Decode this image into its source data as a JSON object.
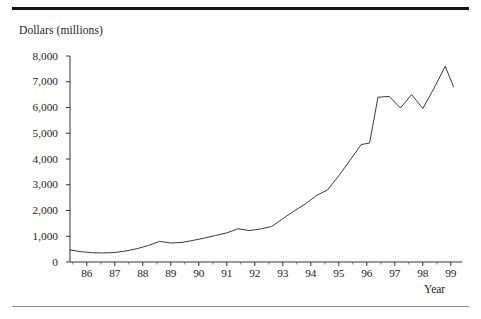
{
  "figure": {
    "y_axis_title": "Dollars (millions)",
    "x_axis_title": "Year"
  },
  "chart_data": {
    "type": "line",
    "title": "",
    "subtitle": "",
    "xlabel": "Year",
    "ylabel": "Dollars (millions)",
    "xlim": [
      85.4,
      99.4
    ],
    "ylim": [
      0,
      8000
    ],
    "grid": false,
    "legend": null,
    "y_ticks": [
      0,
      1000,
      2000,
      3000,
      4000,
      5000,
      6000,
      7000,
      8000
    ],
    "y_tick_labels": [
      "0",
      "1,000",
      "2,000",
      "3,000",
      "4,000",
      "5,000",
      "6,000",
      "7,000",
      "8,000"
    ],
    "x_ticks": [
      86,
      87,
      88,
      89,
      90,
      91,
      92,
      93,
      94,
      95,
      96,
      97,
      98,
      99
    ],
    "x_tick_labels": [
      "86",
      "87",
      "88",
      "89",
      "90",
      "91",
      "92",
      "93",
      "94",
      "95",
      "96",
      "97",
      "98",
      "99"
    ],
    "x_minor_ticks": [
      85.5,
      86.5,
      87.5,
      88.5,
      89.5,
      90.5,
      91.5,
      92.5,
      93.5,
      94.5,
      95.5,
      96.5,
      97.5,
      98.5
    ],
    "series": [
      {
        "name": "Dollars (millions)",
        "x": [
          85.4,
          85.8,
          86.2,
          86.6,
          87.0,
          87.4,
          87.8,
          88.2,
          88.6,
          89.0,
          89.4,
          89.8,
          90.2,
          90.6,
          91.0,
          91.4,
          91.8,
          92.2,
          92.6,
          93.0,
          93.4,
          93.8,
          94.2,
          94.6,
          95.0,
          95.4,
          95.8,
          96.1,
          96.4,
          96.8,
          97.2,
          97.6,
          98.0,
          98.4,
          98.8,
          99.1
        ],
        "values": [
          470,
          400,
          360,
          350,
          370,
          430,
          520,
          640,
          800,
          740,
          760,
          840,
          930,
          1030,
          1130,
          1290,
          1220,
          1280,
          1380,
          1680,
          1980,
          2250,
          2580,
          2800,
          3350,
          3950,
          4560,
          4620,
          6400,
          6430,
          5980,
          6500,
          5960,
          6750,
          7600,
          6800
        ]
      }
    ]
  }
}
